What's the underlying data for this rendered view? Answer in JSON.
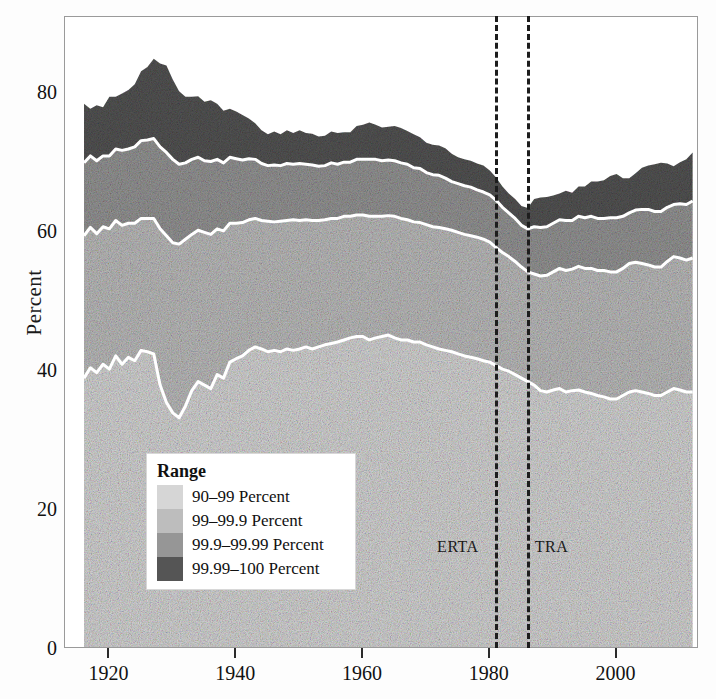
{
  "axes": {
    "ylabel": "Percent",
    "yticks": [
      "0",
      "20",
      "40",
      "60",
      "80"
    ],
    "ytick_values": [
      0,
      20,
      40,
      60,
      80
    ],
    "xticks": [
      "1920",
      "1940",
      "1960",
      "1980",
      "2000"
    ],
    "xtick_values": [
      1920,
      1940,
      1960,
      1980,
      2000
    ],
    "ylim": [
      0,
      91
    ],
    "xlim": [
      1913,
      2013
    ]
  },
  "legend": {
    "title": "Range",
    "items": [
      {
        "label": "90–99 Percent",
        "color": "#d6d6d6"
      },
      {
        "label": "99–99.9 Percent",
        "color": "#bdbdbd"
      },
      {
        "label": "99.9–99.99  Percent",
        "color": "#969696"
      },
      {
        "label": "99.99–100  Percent",
        "color": "#555555"
      }
    ]
  },
  "annotations": [
    {
      "name": "ERTA",
      "label": "ERTA",
      "year": 1981,
      "side": "left"
    },
    {
      "name": "TRA",
      "label": "TRA",
      "year": 1986,
      "side": "right"
    }
  ],
  "chart_data": {
    "type": "area",
    "stacked": true,
    "title": "",
    "xlabel": "",
    "ylabel": "Percent",
    "xlim": [
      1913,
      2013
    ],
    "ylim": [
      0,
      91
    ],
    "grid": false,
    "legend_position": "inside-lower-left",
    "x": [
      1916,
      1917,
      1918,
      1919,
      1920,
      1921,
      1922,
      1923,
      1924,
      1925,
      1926,
      1927,
      1928,
      1929,
      1930,
      1931,
      1932,
      1933,
      1934,
      1935,
      1936,
      1937,
      1938,
      1939,
      1940,
      1941,
      1942,
      1943,
      1944,
      1945,
      1946,
      1947,
      1948,
      1949,
      1950,
      1951,
      1952,
      1953,
      1954,
      1955,
      1956,
      1957,
      1958,
      1959,
      1960,
      1961,
      1962,
      1963,
      1964,
      1965,
      1966,
      1967,
      1968,
      1969,
      1970,
      1971,
      1972,
      1973,
      1974,
      1975,
      1976,
      1977,
      1978,
      1979,
      1980,
      1981,
      1982,
      1983,
      1984,
      1985,
      1986,
      1987,
      1988,
      1989,
      1990,
      1991,
      1992,
      1993,
      1994,
      1995,
      1996,
      1997,
      1998,
      1999,
      2000,
      2001,
      2002,
      2003,
      2004,
      2005,
      2006,
      2007,
      2008,
      2009,
      2010,
      2011,
      2012
    ],
    "series": [
      {
        "name": "90–99 Percent",
        "color": "#d6d6d6",
        "values": [
          39.0,
          40.5,
          39.8,
          41.0,
          40.3,
          42.2,
          41.0,
          42.0,
          41.5,
          43.0,
          42.8,
          42.5,
          38.0,
          35.5,
          34.0,
          33.3,
          35.0,
          37.2,
          38.5,
          38.0,
          37.5,
          39.5,
          39.0,
          41.3,
          41.8,
          42.2,
          43.0,
          43.5,
          43.2,
          42.8,
          43.0,
          42.8,
          43.2,
          43.0,
          43.2,
          43.5,
          43.2,
          43.5,
          43.8,
          44.0,
          44.2,
          44.5,
          44.8,
          45.0,
          45.0,
          44.5,
          44.8,
          45.0,
          45.2,
          44.8,
          44.5,
          44.5,
          44.2,
          44.2,
          43.8,
          43.5,
          43.2,
          43.0,
          42.8,
          42.5,
          42.2,
          42.0,
          41.8,
          41.5,
          41.3,
          40.8,
          40.3,
          40.0,
          39.5,
          39.0,
          38.5,
          38.0,
          37.2,
          37.0,
          37.3,
          37.5,
          37.0,
          37.2,
          37.3,
          37.0,
          36.8,
          36.5,
          36.3,
          36.0,
          36.0,
          36.5,
          37.0,
          37.2,
          37.0,
          36.8,
          36.5,
          36.5,
          37.0,
          37.5,
          37.3,
          37.0,
          37.0
        ]
      },
      {
        "name": "99–99.9 Percent",
        "color": "#bdbdbd",
        "values": [
          20.5,
          20.2,
          20.0,
          19.8,
          20.2,
          19.5,
          20.0,
          19.3,
          19.8,
          19.0,
          19.2,
          19.5,
          22.5,
          24.0,
          24.5,
          25.0,
          24.0,
          22.5,
          21.8,
          22.0,
          22.2,
          21.0,
          21.2,
          20.0,
          19.5,
          19.2,
          18.8,
          18.5,
          18.5,
          18.8,
          18.5,
          18.8,
          18.5,
          18.8,
          18.5,
          18.3,
          18.5,
          18.2,
          18.0,
          18.0,
          17.8,
          17.8,
          17.5,
          17.5,
          17.5,
          17.8,
          17.5,
          17.3,
          17.2,
          17.5,
          17.5,
          17.3,
          17.3,
          17.2,
          17.3,
          17.3,
          17.5,
          17.5,
          17.5,
          17.5,
          17.5,
          17.5,
          17.5,
          17.5,
          17.3,
          17.0,
          16.8,
          16.5,
          16.3,
          16.0,
          15.8,
          16.0,
          16.5,
          16.8,
          17.0,
          17.3,
          17.5,
          17.5,
          17.8,
          17.8,
          18.0,
          18.0,
          18.2,
          18.3,
          18.3,
          18.3,
          18.5,
          18.5,
          18.5,
          18.5,
          18.5,
          18.5,
          18.8,
          19.0,
          19.0,
          19.0,
          19.3
        ]
      },
      {
        "name": "99.9–99.99  Percent",
        "color": "#969696",
        "values": [
          10.5,
          10.3,
          10.5,
          10.2,
          10.5,
          10.3,
          10.8,
          10.7,
          11.0,
          11.2,
          11.3,
          11.5,
          11.8,
          12.0,
          12.0,
          11.5,
          11.0,
          10.8,
          10.5,
          10.3,
          10.5,
          10.0,
          9.8,
          9.5,
          9.3,
          9.0,
          8.8,
          8.5,
          8.2,
          8.0,
          8.2,
          8.0,
          8.2,
          8.0,
          8.2,
          8.0,
          8.0,
          7.8,
          7.8,
          8.0,
          7.8,
          7.8,
          7.8,
          8.0,
          8.0,
          8.2,
          8.2,
          8.0,
          8.0,
          8.0,
          8.0,
          8.0,
          7.8,
          7.8,
          7.5,
          7.5,
          7.5,
          7.3,
          7.0,
          7.0,
          7.0,
          7.0,
          6.8,
          6.8,
          6.8,
          6.8,
          6.5,
          6.3,
          6.2,
          6.0,
          6.2,
          6.8,
          7.0,
          7.0,
          7.0,
          7.0,
          7.2,
          7.0,
          7.2,
          7.3,
          7.5,
          7.5,
          7.5,
          7.8,
          7.8,
          7.5,
          7.3,
          7.5,
          7.8,
          8.0,
          8.0,
          8.0,
          7.8,
          7.5,
          7.8,
          8.0,
          8.2
        ]
      },
      {
        "name": "99.99–100  Percent",
        "color": "#555555",
        "values": [
          8.5,
          6.8,
          8.0,
          7.0,
          8.5,
          7.5,
          8.2,
          8.5,
          9.0,
          10.0,
          10.5,
          11.5,
          12.0,
          12.5,
          11.5,
          10.5,
          9.5,
          9.0,
          8.8,
          8.5,
          8.8,
          8.0,
          7.5,
          7.0,
          6.8,
          6.5,
          5.8,
          5.2,
          4.8,
          4.5,
          4.8,
          4.5,
          4.8,
          4.5,
          4.8,
          4.5,
          4.5,
          4.3,
          4.3,
          4.5,
          4.5,
          4.3,
          4.3,
          4.8,
          5.0,
          5.3,
          5.0,
          4.8,
          4.8,
          5.0,
          5.0,
          4.8,
          4.8,
          4.5,
          4.3,
          4.3,
          4.3,
          4.3,
          4.0,
          3.8,
          3.8,
          3.8,
          3.8,
          3.8,
          3.5,
          3.3,
          3.0,
          2.8,
          2.8,
          2.8,
          3.0,
          4.0,
          4.3,
          4.3,
          4.0,
          3.8,
          4.3,
          4.0,
          4.3,
          4.5,
          5.0,
          5.3,
          5.5,
          6.0,
          6.3,
          5.5,
          5.0,
          5.3,
          6.0,
          6.3,
          6.8,
          7.0,
          6.3,
          5.5,
          6.0,
          6.5,
          7.0
        ]
      }
    ]
  }
}
